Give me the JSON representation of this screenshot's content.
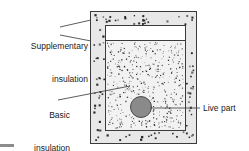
{
  "figure": {
    "type": "technical-diagram",
    "background_color": "#ffffff"
  },
  "labels": {
    "supplementary": {
      "line1": "Supplementary",
      "line2": "insulation"
    },
    "basic": {
      "line1": "Basic",
      "line2": "insulation"
    },
    "live_part": "Live part"
  },
  "colors": {
    "outline": "#3b3b3b",
    "supplementary_fill": "#e8e8e8",
    "basic_fill": "#f2f2f2",
    "inner_void_fill": "#ffffff",
    "live_part_fill": "#8a8a8a",
    "live_part_stroke": "#4a4a4a",
    "leader_line": "#4a4a4a",
    "speckle_dark": "#2a2a2a",
    "speckle_mid": "#6b6b6b",
    "corner_mark": "#8c8c8c",
    "text": "#1a1a1a"
  },
  "geometry": {
    "outer_box": {
      "x": 90,
      "y": 11,
      "width": 106,
      "height": 132
    },
    "inner_box": {
      "x": 105,
      "y": 25,
      "width": 80,
      "height": 105
    },
    "inner_fill_top": 40,
    "live_part_circle": {
      "cx": 141,
      "cy": 107,
      "r": 10.5
    }
  },
  "leaders": {
    "supplementary_upper": {
      "x1": 91,
      "y1": 20,
      "x2": 60,
      "y2": 27
    },
    "supplementary_lower": {
      "x1": 91,
      "y1": 41,
      "x2": 60,
      "y2": 35
    },
    "basic": {
      "x1": 130,
      "y1": 86,
      "x2": 58,
      "y2": 100
    },
    "live_part": {
      "x1": 150,
      "y1": 108,
      "x2": 200,
      "y2": 108
    }
  },
  "speckles": {
    "supplementary_dot_count": 96,
    "supplementary_dot_size_px": 1.6,
    "basic_dot_count": 430,
    "basic_dot_size_px": 0.85,
    "description": "Outer ring filled with sparse larger dots; inner region filled with dense fine stipple"
  }
}
